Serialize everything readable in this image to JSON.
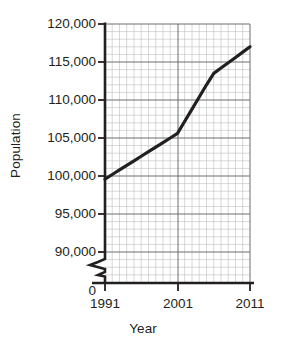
{
  "chart_data": {
    "type": "line",
    "title": "",
    "xlabel": "Year",
    "ylabel": "Population",
    "x": [
      1991,
      1992,
      1993,
      1994,
      1995,
      1996,
      1997,
      1998,
      1999,
      2000,
      2001,
      2002,
      2003,
      2004,
      2005,
      2006,
      2007,
      2008,
      2009,
      2010,
      2011
    ],
    "values": [
      99600,
      100200,
      100800,
      101400,
      102000,
      102600,
      103200,
      103800,
      104400,
      105000,
      105600,
      107200,
      108800,
      110400,
      112000,
      113500,
      114200,
      114900,
      115600,
      116300,
      117000
    ],
    "series": [
      {
        "name": "Population",
        "values": [
          99600,
          100200,
          100800,
          101400,
          102000,
          102600,
          103200,
          103800,
          104400,
          105000,
          105600,
          107200,
          108800,
          110400,
          112000,
          113500,
          114200,
          114900,
          115600,
          116300,
          117000
        ]
      }
    ],
    "key_points": [
      {
        "year": 1991,
        "population": 99600
      },
      {
        "year": 2001,
        "population": 105600
      },
      {
        "year": 2006,
        "population": 113500
      },
      {
        "year": 2011,
        "population": 117000
      }
    ],
    "xlim": [
      1991,
      2011
    ],
    "ylim": [
      90000,
      120000
    ],
    "y_axis_break": true,
    "y_axis_break_note": "axis broken between 0 and 90,000",
    "grid": true,
    "grid_minor": true,
    "legend": "none",
    "y_tick_labels": [
      "120,000",
      "115,000",
      "110,000",
      "105,000",
      "100,000",
      "95,000",
      "90,000",
      "0"
    ],
    "y_tick_values": [
      120000,
      115000,
      110000,
      105000,
      100000,
      95000,
      90000,
      0
    ],
    "x_tick_labels": [
      "1991",
      "2001",
      "2011"
    ],
    "x_tick_values": [
      1991,
      2001,
      2011
    ],
    "minor_ticks_per_major_y": 5,
    "minor_ticks_per_major_x": 5,
    "colors": {
      "line": "#231f20",
      "axis": "#231f20",
      "grid_major": "#6d6e71",
      "grid_minor": "#bcbec0",
      "background": "#ffffff"
    }
  }
}
